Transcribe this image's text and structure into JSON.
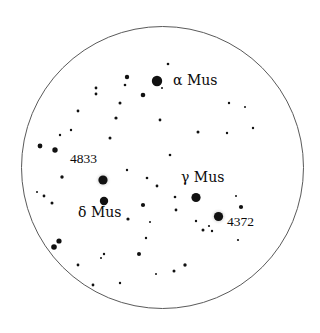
{
  "chart": {
    "kind": "star-chart",
    "background_color": "#ffffff",
    "field_circle": {
      "name": "field-of-view-circle",
      "cx": 162.5,
      "cy": 167.5,
      "r": 141.0,
      "stroke_color": "#5a5a5a",
      "stroke_width": 1.0,
      "fill": "#ffffff"
    },
    "star_color": "#111111",
    "halo_color": "#b9b9b9",
    "label_color": "#0a0a0a"
  },
  "labels": [
    {
      "id": "alpha-mus",
      "text": "α Mus",
      "x": 173,
      "y": 73,
      "kind": "greek"
    },
    {
      "id": "gamma-mus",
      "text": "γ Mus",
      "x": 181,
      "y": 170,
      "kind": "greek"
    },
    {
      "id": "delta-mus",
      "text": "δ Mus",
      "x": 78,
      "y": 205,
      "kind": "greek"
    },
    {
      "id": "ngc-4833",
      "text": "4833",
      "x": 70,
      "y": 152,
      "kind": "number"
    },
    {
      "id": "ngc-4372",
      "text": "4372",
      "x": 227,
      "y": 215,
      "kind": "number"
    }
  ],
  "objects": [
    {
      "id": "alpha-mus-star",
      "name": "star-alpha-mus",
      "type": "star",
      "x": 157,
      "y": 81,
      "r": 5.2
    },
    {
      "id": "gamma-mus-star",
      "name": "star-gamma-mus",
      "type": "star",
      "x": 196,
      "y": 197.5,
      "r": 4.6
    },
    {
      "id": "delta-mus-star",
      "name": "star-delta-mus",
      "type": "star",
      "x": 104,
      "y": 201,
      "r": 4.2
    },
    {
      "id": "ngc4833-obj",
      "name": "cluster-ngc-4833",
      "type": "cluster",
      "x": 103,
      "y": 180,
      "r": 4.6,
      "halo_r": 8.4
    },
    {
      "id": "ngc4372-obj",
      "name": "cluster-ngc-4372",
      "type": "cluster",
      "x": 218.5,
      "y": 216.5,
      "r": 4.6,
      "halo_r": 8.6
    }
  ],
  "field_stars": [
    {
      "x": 127,
      "y": 77,
      "r": 2.2
    },
    {
      "x": 143,
      "y": 95,
      "r": 2.3
    },
    {
      "x": 125,
      "y": 85,
      "r": 1.3
    },
    {
      "x": 96,
      "y": 88,
      "r": 1.4
    },
    {
      "x": 96,
      "y": 94,
      "r": 1.4
    },
    {
      "x": 120,
      "y": 103,
      "r": 1.5
    },
    {
      "x": 78,
      "y": 111,
      "r": 1.4
    },
    {
      "x": 116,
      "y": 118,
      "r": 1.6
    },
    {
      "x": 71,
      "y": 130,
      "r": 1.2
    },
    {
      "x": 110,
      "y": 138,
      "r": 1.5
    },
    {
      "x": 162,
      "y": 88,
      "r": 1.0
    },
    {
      "x": 168,
      "y": 64,
      "r": 1.3
    },
    {
      "x": 229,
      "y": 103,
      "r": 1.2
    },
    {
      "x": 245,
      "y": 107,
      "r": 1.0
    },
    {
      "x": 227,
      "y": 133,
      "r": 1.2
    },
    {
      "x": 253,
      "y": 128,
      "r": 1.2
    },
    {
      "x": 198,
      "y": 132,
      "r": 1.5
    },
    {
      "x": 160,
      "y": 120,
      "r": 1.4
    },
    {
      "x": 170,
      "y": 155,
      "r": 1.3
    },
    {
      "x": 40,
      "y": 146,
      "r": 2.4
    },
    {
      "x": 55,
      "y": 150,
      "r": 2.7
    },
    {
      "x": 60,
      "y": 135,
      "r": 1.2
    },
    {
      "x": 62,
      "y": 177,
      "r": 1.7
    },
    {
      "x": 37,
      "y": 192,
      "r": 1.0
    },
    {
      "x": 44,
      "y": 196,
      "r": 1.4
    },
    {
      "x": 52,
      "y": 203,
      "r": 1.5
    },
    {
      "x": 127,
      "y": 170,
      "r": 1.2
    },
    {
      "x": 147,
      "y": 178,
      "r": 1.3
    },
    {
      "x": 157,
      "y": 186,
      "r": 1.4
    },
    {
      "x": 143,
      "y": 205,
      "r": 2.1
    },
    {
      "x": 175,
      "y": 197,
      "r": 1.3
    },
    {
      "x": 176,
      "y": 210,
      "r": 1.4
    },
    {
      "x": 128,
      "y": 219,
      "r": 1.6
    },
    {
      "x": 150,
      "y": 222,
      "r": 1.0
    },
    {
      "x": 196,
      "y": 221,
      "r": 1.2
    },
    {
      "x": 203,
      "y": 230,
      "r": 1.5
    },
    {
      "x": 209,
      "y": 226,
      "r": 1.1
    },
    {
      "x": 212,
      "y": 231,
      "r": 1.2
    },
    {
      "x": 241,
      "y": 207,
      "r": 2.1
    },
    {
      "x": 236,
      "y": 196,
      "r": 1.0
    },
    {
      "x": 238,
      "y": 240,
      "r": 1.1
    },
    {
      "x": 146,
      "y": 238,
      "r": 1.2
    },
    {
      "x": 59,
      "y": 241,
      "r": 2.6
    },
    {
      "x": 54,
      "y": 247,
      "r": 2.8
    },
    {
      "x": 104,
      "y": 254,
      "r": 1.2
    },
    {
      "x": 139,
      "y": 254,
      "r": 2.0
    },
    {
      "x": 101,
      "y": 258,
      "r": 1.0
    },
    {
      "x": 185,
      "y": 265,
      "r": 1.7
    },
    {
      "x": 78,
      "y": 265,
      "r": 1.4
    },
    {
      "x": 156,
      "y": 274,
      "r": 1.0
    },
    {
      "x": 174,
      "y": 271,
      "r": 1.5
    },
    {
      "x": 93,
      "y": 285,
      "r": 1.4
    },
    {
      "x": 120,
      "y": 283,
      "r": 1.2
    }
  ]
}
